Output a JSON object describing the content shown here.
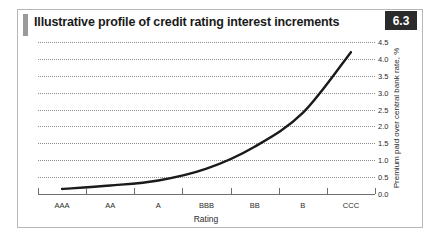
{
  "figure": {
    "title": "Illustrative profile of credit rating interest increments",
    "number": "6.3"
  },
  "chart_data": {
    "type": "line",
    "title": "Illustrative profile of credit rating interest increments",
    "xlabel": "Rating",
    "ylabel": "Premium paid over central bank rate, %",
    "categories": [
      "AAA",
      "AA",
      "A",
      "BBB",
      "BB",
      "B",
      "CCC"
    ],
    "values": [
      0.15,
      0.25,
      0.4,
      0.75,
      1.4,
      2.4,
      4.2
    ],
    "series": [
      {
        "name": "Premium paid over central bank rate",
        "values": [
          0.15,
          0.25,
          0.4,
          0.75,
          1.4,
          2.4,
          4.2
        ]
      }
    ],
    "ylim": [
      0.0,
      4.5
    ],
    "yticks": [
      "0.0",
      "0.5",
      "1.0",
      "1.5",
      "2.0",
      "2.5",
      "3.0",
      "3.5",
      "4.0",
      "4.5"
    ],
    "ytick_values": [
      0.0,
      0.5,
      1.0,
      1.5,
      2.0,
      2.5,
      3.0,
      3.5,
      4.0,
      4.5
    ],
    "grid": true,
    "grid_style": "dotted",
    "legend": "none",
    "line_color": "#1a1a1a"
  }
}
